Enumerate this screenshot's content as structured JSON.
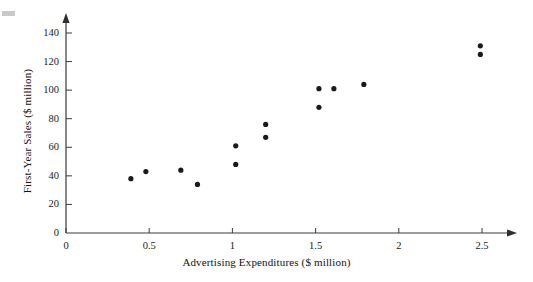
{
  "chart_data": {
    "type": "scatter",
    "title": "",
    "xlabel": "Advertising Expenditures ($ million)",
    "ylabel": "First-Year Sales ($ million)",
    "xlim": [
      0,
      2.6
    ],
    "ylim": [
      0,
      145
    ],
    "xticks": [
      0,
      0.5,
      1,
      1.5,
      2,
      2.5
    ],
    "xtick_labels": [
      "0",
      "0.5",
      "1",
      "1.5",
      "2",
      "2.5"
    ],
    "yticks": [
      0,
      20,
      40,
      60,
      80,
      100,
      120,
      140
    ],
    "ytick_labels": [
      "0",
      "20",
      "40",
      "60",
      "80",
      "100",
      "120",
      "140"
    ],
    "grid": false,
    "legend": false,
    "marker": "filled-circle",
    "marker_color": "#1a1a1a",
    "axis_color": "#3a3a3a",
    "points": [
      {
        "x": 0.39,
        "y": 38
      },
      {
        "x": 0.48,
        "y": 43
      },
      {
        "x": 0.69,
        "y": 44
      },
      {
        "x": 0.79,
        "y": 34
      },
      {
        "x": 1.02,
        "y": 61
      },
      {
        "x": 1.02,
        "y": 48
      },
      {
        "x": 1.2,
        "y": 76
      },
      {
        "x": 1.2,
        "y": 67
      },
      {
        "x": 1.52,
        "y": 101
      },
      {
        "x": 1.52,
        "y": 88
      },
      {
        "x": 1.61,
        "y": 101
      },
      {
        "x": 1.79,
        "y": 104
      },
      {
        "x": 2.49,
        "y": 131
      },
      {
        "x": 2.49,
        "y": 125
      }
    ]
  }
}
